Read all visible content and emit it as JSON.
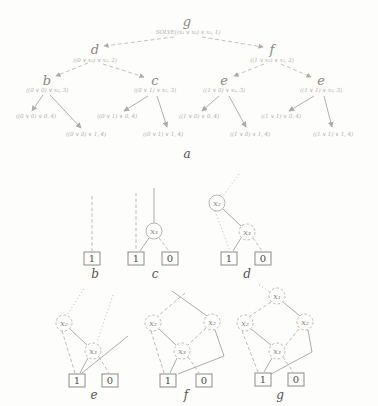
{
  "figure": {
    "tree": {
      "caption": "a",
      "root_name": "g",
      "root_label": "SOLVE((x₁ ∨ x₂) ∨ x₃, 1)",
      "level2": [
        {
          "name": "d",
          "label": "((0 ∨ x₂) ∨ x₃, 2)"
        },
        {
          "name": "f",
          "label": "((1 ∨ x₂) ∨ x₃, 2)"
        }
      ],
      "level3": [
        {
          "name": "b",
          "label": "((0 ∨ 0) ∨ x₃, 3)"
        },
        {
          "name": "c",
          "label": "((0 ∨ 1) ∨ x₃, 3)"
        },
        {
          "name": "e",
          "label": "((1 ∨ 0) ∨ x₃, 3)"
        },
        {
          "name": "e",
          "label": "((1 ∨ 1) ∨ x₃, 3)"
        }
      ],
      "leaves": [
        "((0 ∨ 0) ∨ 0, 4)",
        "((0 ∨ 0) ∨ 1, 4)",
        "((0 ∨ 1) ∨ 0, 4)",
        "((0 ∨ 1) ∨ 1, 4)",
        "((1 ∨ 0) ∨ 0, 4)",
        "((1 ∨ 0) ∨ 1, 4)",
        "((1 ∨ 1) ∨ 0, 4)",
        "((1 ∨ 1) ∨ 1, 4)"
      ]
    },
    "diagrams": {
      "b": {
        "caption": "b",
        "one": "1"
      },
      "c": {
        "caption": "c",
        "x3": "x₃",
        "one": "1",
        "zero": "0"
      },
      "d": {
        "caption": "d",
        "x2": "x₂",
        "x3": "x₃",
        "one": "1",
        "zero": "0"
      },
      "e": {
        "caption": "e",
        "x2": "x₂",
        "x3": "x₃",
        "one": "1",
        "zero": "0"
      },
      "f": {
        "caption": "f",
        "x2_left": "x₂",
        "x2_right": "x₂",
        "x3": "x₃",
        "one": "1",
        "zero": "0"
      },
      "g": {
        "caption": "g",
        "x1": "x₁",
        "x2_left": "x₂",
        "x2_right": "x₂",
        "x3": "x₃",
        "one": "1",
        "zero": "0"
      }
    },
    "colors": {
      "background": "#fdfdfc",
      "faint_line": "#b3b0ac",
      "ink": "#55524e"
    }
  }
}
